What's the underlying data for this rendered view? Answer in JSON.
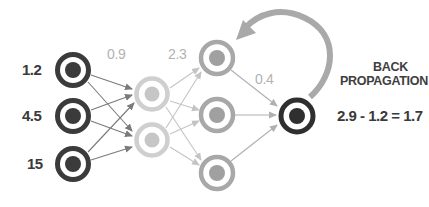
{
  "diagram": {
    "colors": {
      "input": "#3b3b3b",
      "hidden1": "#cfcfcf",
      "hidden2": "#a8a8a8",
      "output": "#2f2f2f",
      "arrow_dark": "#7a7a7a",
      "arrow_light": "#c4c4c4",
      "back_arrow": "#a9a9a9"
    },
    "input_values": [
      "1.2",
      "4.5",
      "15"
    ],
    "weights": {
      "w1": "0.9",
      "w2": "2.3",
      "w3": "0.4"
    },
    "layers": [
      {
        "name": "input",
        "count": 3
      },
      {
        "name": "hidden-1",
        "count": 2
      },
      {
        "name": "hidden-2",
        "count": 3
      },
      {
        "name": "output",
        "count": 1
      }
    ],
    "back_propagation": {
      "title_line1": "BACK",
      "title_line2": "PROPAGATION",
      "equation": "2.9 - 1.2 = 1.7"
    }
  }
}
